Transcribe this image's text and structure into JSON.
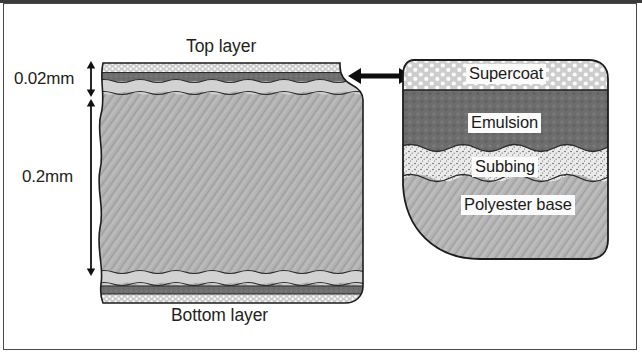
{
  "figure": {
    "title_top": "Top layer",
    "title_bottom": "Bottom layer",
    "background_color": "#ffffff",
    "border_color": "#4a4a4a"
  },
  "dimensions": [
    {
      "name": "coating-thickness",
      "label": "0.02mm"
    },
    {
      "name": "base-thickness",
      "label": "0.2mm"
    }
  ],
  "left_block": {
    "top_label": "Top layer",
    "bottom_label": "Bottom layer"
  },
  "connector": {
    "icon": "double-arrow-icon",
    "direction": "horizontal"
  },
  "right_block": {
    "layers": [
      {
        "name": "supercoat",
        "label": "Supercoat",
        "color": "#d8d8d8",
        "pattern": "dots"
      },
      {
        "name": "emulsion",
        "label": "Emulsion",
        "color": "#6e6e6e",
        "pattern": "stipple"
      },
      {
        "name": "subbing",
        "label": "Subbing",
        "color": "#e3e3e3",
        "pattern": "speckle"
      },
      {
        "name": "polyester-base",
        "label": "Polyester base",
        "color": "#b0b0b0",
        "pattern": "diagonal-hatch"
      }
    ]
  },
  "colors": {
    "supercoat": "#d8d8d8",
    "emulsion": "#6e6e6e",
    "subbing": "#e3e3e3",
    "polyester": "#b0b0b0",
    "outline": "#1a1a1a",
    "text": "#231f20"
  }
}
